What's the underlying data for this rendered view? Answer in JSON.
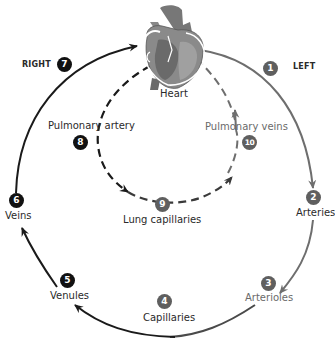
{
  "colors": {
    "systemic_return": "#1a1a1a",
    "systemic_outflow": "#6e6e6e",
    "pulmonary": "#3a3a3a",
    "background": "#ffffff"
  },
  "sides": {
    "right": "RIGHT",
    "left": "LEFT"
  },
  "heart": {
    "label": "Heart"
  },
  "steps": [
    {
      "number": "1",
      "label": "",
      "note": "LEFT side outflow"
    },
    {
      "number": "2",
      "label": "Arteries"
    },
    {
      "number": "3",
      "label": "Arterioles"
    },
    {
      "number": "4",
      "label": "Capillaries"
    },
    {
      "number": "5",
      "label": "Venules"
    },
    {
      "number": "6",
      "label": "Veins"
    },
    {
      "number": "7",
      "label": "",
      "note": "RIGHT side return"
    },
    {
      "number": "8",
      "label": "Pulmonary artery"
    },
    {
      "number": "9",
      "label": "Lung capillaries"
    },
    {
      "number": "10",
      "label": "Pulmonary veins"
    }
  ]
}
